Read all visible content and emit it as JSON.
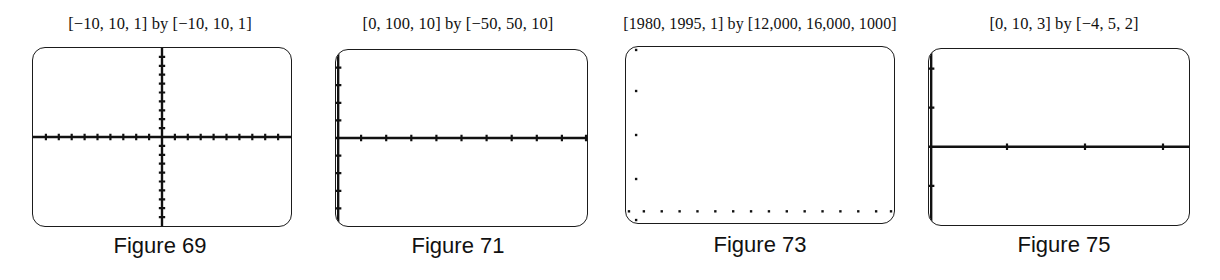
{
  "page": {
    "background_color": "#ffffff",
    "ink_color": "#111111"
  },
  "figures": [
    {
      "id": "figure-69",
      "range_label": "[−10, 10, 1] by [−10, 10, 1]",
      "caption": "Figure 69"
    },
    {
      "id": "figure-71",
      "range_label": "[0, 100, 10] by [−50, 50, 10]",
      "caption": "Figure 71"
    },
    {
      "id": "figure-73",
      "range_label": "[1980, 1995, 1] by [12,000, 16,000, 1000]",
      "caption": "Figure 73"
    },
    {
      "id": "figure-75",
      "range_label": "[0, 10, 3] by [−4, 5, 2]",
      "caption": "Figure 75"
    }
  ],
  "chart_data": [
    {
      "type": "scatter",
      "title": "[−10, 10, 1] by [−10, 10, 1]",
      "caption": "Figure 69",
      "xlabel": "",
      "ylabel": "",
      "xlim": [
        -10,
        10
      ],
      "ylim": [
        -10,
        10
      ],
      "xscl": 1,
      "yscl": 1,
      "grid": false,
      "legend": "none",
      "axes_visible": {
        "x_axis": true,
        "y_axis": true
      },
      "x_axis_at_y": 0,
      "y_axis_at_x": 0,
      "x_ticks": [
        -9,
        -8,
        -7,
        -6,
        -5,
        -4,
        -3,
        -2,
        -1,
        1,
        2,
        3,
        4,
        5,
        6,
        7,
        8,
        9
      ],
      "y_ticks": [
        -9,
        -8,
        -7,
        -6,
        -5,
        -4,
        -3,
        -2,
        -1,
        1,
        2,
        3,
        4,
        5,
        6,
        7,
        8,
        9
      ],
      "values": []
    },
    {
      "type": "scatter",
      "title": "[0, 100, 10] by [−50, 50, 10]",
      "caption": "Figure 71",
      "xlabel": "",
      "ylabel": "",
      "xlim": [
        0,
        100
      ],
      "ylim": [
        -50,
        50
      ],
      "xscl": 10,
      "yscl": 10,
      "grid": false,
      "legend": "none",
      "axes_visible": {
        "x_axis": true,
        "y_axis": true
      },
      "x_axis_at_y": 0,
      "y_axis_at_x": 0,
      "x_ticks": [
        10,
        20,
        30,
        40,
        50,
        60,
        70,
        80,
        90,
        100
      ],
      "y_ticks": [
        -50,
        -40,
        -30,
        -20,
        -10,
        10,
        20,
        30,
        40,
        50
      ],
      "values": []
    },
    {
      "type": "scatter",
      "title": "[1980, 1995, 1] by [12,000, 16,000, 1000]",
      "caption": "Figure 73",
      "xlabel": "",
      "ylabel": "",
      "xlim": [
        1980,
        1995
      ],
      "ylim": [
        12000,
        16000
      ],
      "xscl": 1,
      "yscl": 1000,
      "grid": false,
      "legend": "none",
      "axes_visible": {
        "x_axis": false,
        "y_axis": false
      },
      "x_axis_at_y": null,
      "y_axis_at_x": null,
      "x_ticks": [
        1980,
        1981,
        1982,
        1983,
        1984,
        1985,
        1986,
        1987,
        1988,
        1989,
        1990,
        1991,
        1992,
        1993,
        1994,
        1995
      ],
      "y_ticks": [
        12000,
        13000,
        14000,
        15000,
        16000
      ],
      "values": []
    },
    {
      "type": "scatter",
      "title": "[0, 10, 3] by [−4, 5, 2]",
      "caption": "Figure 75",
      "xlabel": "",
      "ylabel": "",
      "xlim": [
        0,
        10
      ],
      "ylim": [
        -4,
        5
      ],
      "xscl": 3,
      "yscl": 2,
      "grid": false,
      "legend": "none",
      "axes_visible": {
        "x_axis": true,
        "y_axis": true
      },
      "x_axis_at_y": 0,
      "y_axis_at_x": 0,
      "x_ticks": [
        3,
        6,
        9
      ],
      "y_ticks": [
        -4,
        -2,
        2,
        4
      ],
      "values": []
    }
  ]
}
